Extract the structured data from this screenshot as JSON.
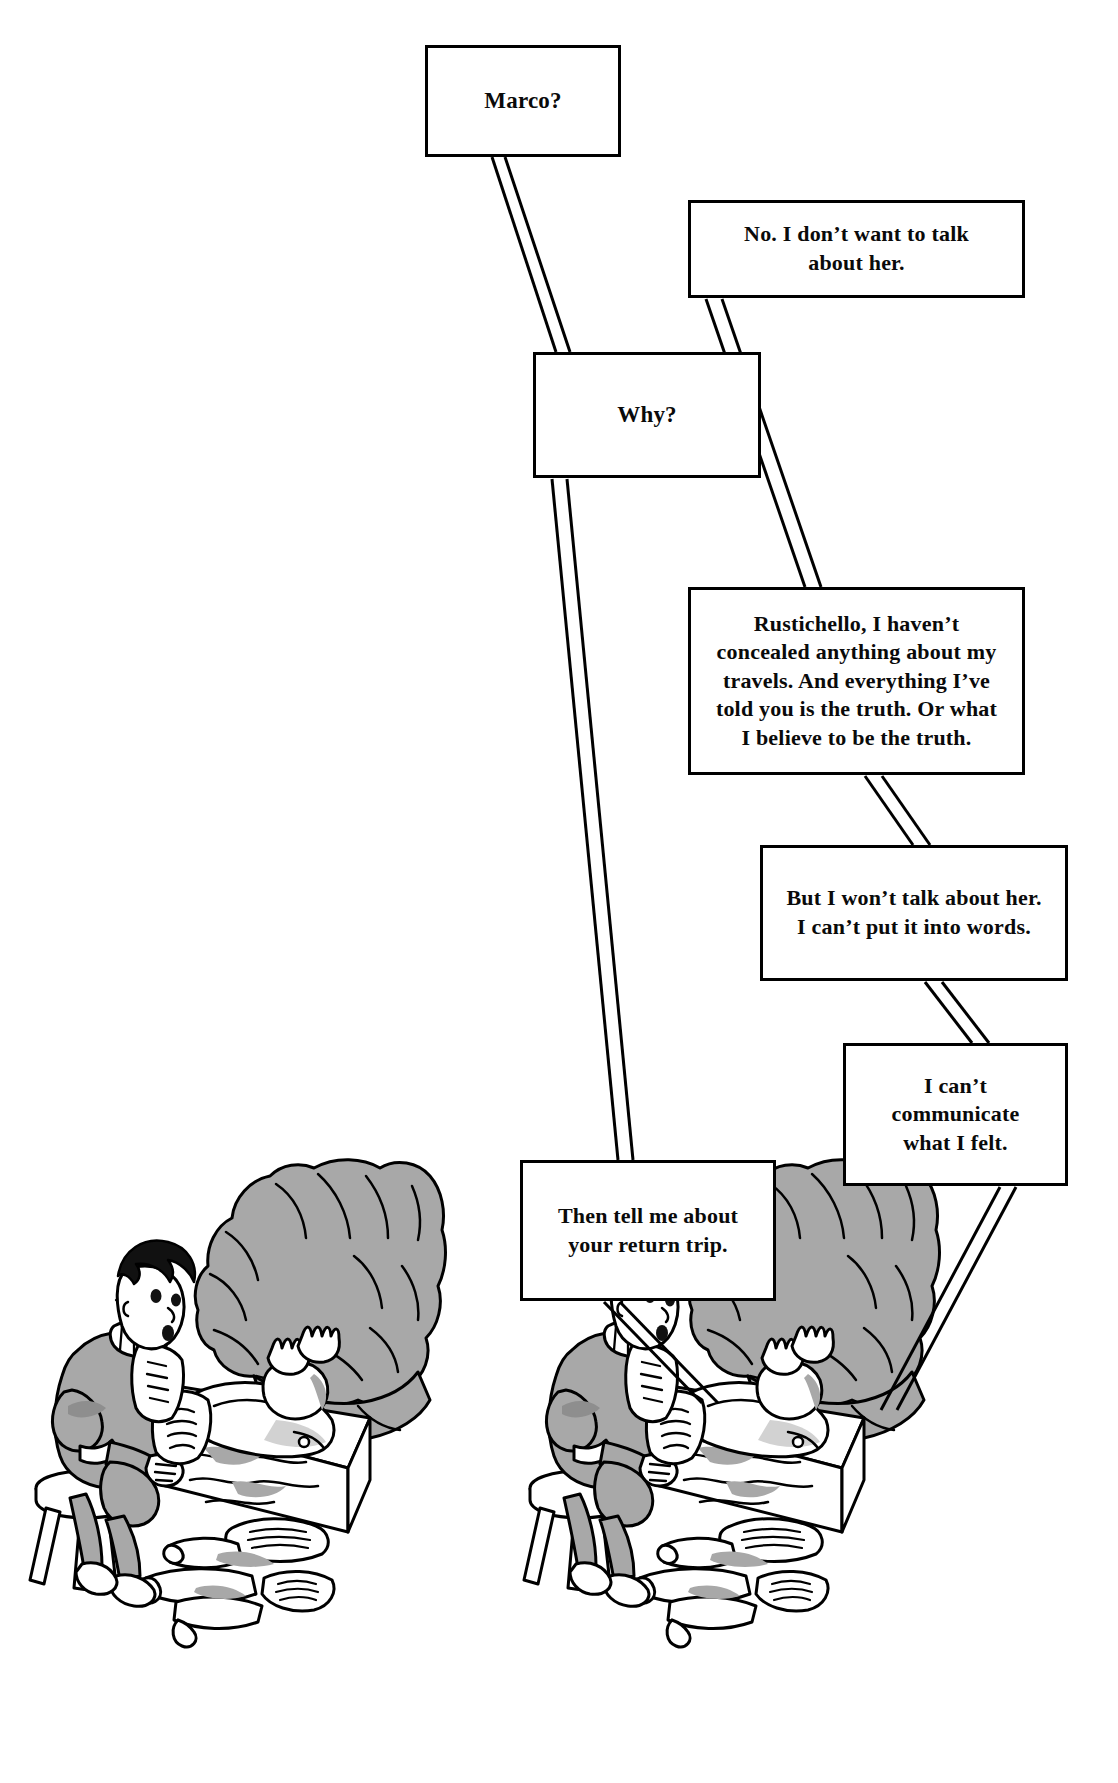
{
  "page": {
    "width": 1118,
    "height": 1783,
    "background_color": "#ffffff",
    "ink_color": "#000000",
    "shade_color": "#a8a8a8"
  },
  "balloons": [
    {
      "id": "marco",
      "speaker": "Rustichello",
      "text": "Marco?"
    },
    {
      "id": "no",
      "speaker": "Marco",
      "text": "No. I don’t want to talk\nabout her."
    },
    {
      "id": "why",
      "speaker": "Rustichello",
      "text": "Why?"
    },
    {
      "id": "rust",
      "speaker": "Marco",
      "text": "Rustichello, I haven’t\nconcealed anything about my\ntravels. And everything I’ve\ntold you is the truth. Or what\nI believe to be the truth."
    },
    {
      "id": "butwont",
      "speaker": "Marco",
      "text": "But I won’t talk about her.\nI can’t put it into words."
    },
    {
      "id": "cantcomm",
      "speaker": "Marco",
      "text": "I can’t\ncommunicate\nwhat I felt."
    },
    {
      "id": "return",
      "speaker": "Rustichello",
      "text": "Then tell me about\nyour return trip."
    }
  ],
  "illustrations": [
    {
      "id": "scene-left",
      "caption": "Rustichello seated on a three-legged stool writing with a quill beside Marco Polo lying in bed under a grey blanket, scrolls on the floor"
    },
    {
      "id": "scene-right",
      "caption": "Rustichello seated on a three-legged stool writing with a quill beside Marco Polo lying in bed under a grey blanket, scrolls on the floor"
    }
  ]
}
